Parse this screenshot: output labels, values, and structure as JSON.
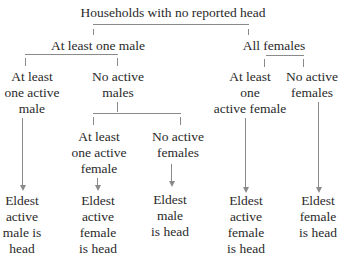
{
  "diagram": {
    "type": "decision-tree",
    "line_color": "#8a8a8a",
    "text_color": "#2a2a2a",
    "root": {
      "label": "Households with no reported head"
    },
    "level1": [
      {
        "label": "At least one male"
      },
      {
        "label": "All females"
      }
    ],
    "level2": {
      "male_branch": [
        {
          "lines": [
            "At least",
            "one active",
            "male"
          ]
        },
        {
          "lines": [
            "No active",
            "males"
          ]
        }
      ],
      "female_branch": [
        {
          "lines": [
            "At least",
            "one",
            "active female"
          ]
        },
        {
          "lines": [
            "No active",
            "females"
          ]
        }
      ]
    },
    "level3": {
      "no_active_males_branch": [
        {
          "lines": [
            "At least",
            "one active",
            "female"
          ]
        },
        {
          "lines": [
            "No active",
            "females"
          ]
        }
      ]
    },
    "outcomes": [
      {
        "lines": [
          "Eldest",
          "active",
          "male is",
          "head"
        ]
      },
      {
        "lines": [
          "Eldest",
          "active",
          "female",
          "is head"
        ]
      },
      {
        "lines": [
          "Eldest",
          "male",
          "is head"
        ]
      },
      {
        "lines": [
          "Eldest",
          "active",
          "female",
          "is head"
        ]
      },
      {
        "lines": [
          "Eldest",
          "female",
          "is head"
        ]
      }
    ]
  }
}
